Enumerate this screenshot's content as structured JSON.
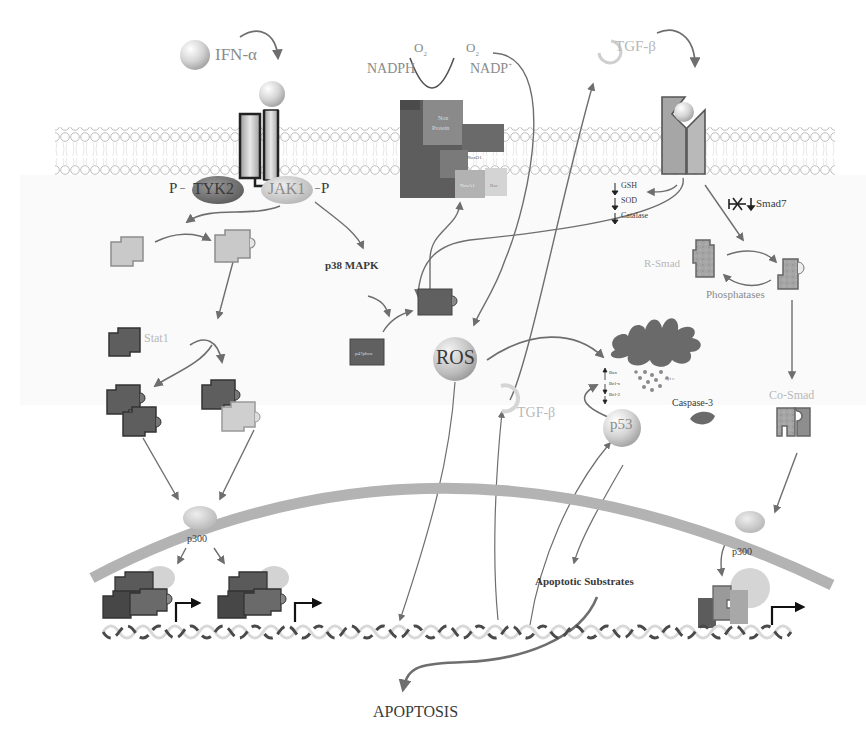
{
  "diagram": {
    "type": "signaling-pathway",
    "ligands": {
      "ifn": "IFN-α",
      "tgf_top": "TGF-β",
      "tgf_mid": "TGF-β"
    },
    "receptor_kinases": {
      "tyk2": "TYK2",
      "jak1": "JAK1",
      "phospho_left": "P",
      "phospho_right": "P"
    },
    "nadph_oxidase": {
      "o2_left": "O",
      "o2_left_sub": "2",
      "o2_right": "O",
      "o2_right_sub": "2",
      "nadph": "NADPH",
      "nadp": "NADP",
      "nadp_sup": "+",
      "subunits": [
        "Nox Protein",
        "p22phox",
        "p67phox",
        "NoxO1",
        "NoxA1",
        "Rac",
        "p47phox"
      ]
    },
    "cytoplasm": {
      "p38": "p38 MAPK",
      "p47_inactive": "p47phox",
      "p47_active": "p47phox",
      "ros": "ROS",
      "stat1": "Stat1",
      "antioxidants": [
        "GSH",
        "SOD",
        "Catalase"
      ],
      "smad7": "Smad7",
      "r_smad": "R-Smad",
      "phosphatases": "Phosphatases",
      "co_smad": "Co-Smad",
      "mito_factors": [
        "Bax",
        "Bcl-x",
        "Bcl-2"
      ],
      "cytc": "cyt c",
      "p53": "p53",
      "caspase3": "Caspase-3"
    },
    "nucleus": {
      "p300_left": "p300",
      "p300_right": "p300",
      "apoptotic_substrates": "Apoptotic Substrates"
    },
    "outcome": "APOPTOSIS",
    "colors": {
      "arrow": "#6e6e6e",
      "membrane": "#c8c8c8",
      "nuclear_envelope": "#9a9a9a",
      "dark_protein": "#5a5a5a",
      "light_protein": "#c9c9c9",
      "smad": "#8d8d8d"
    }
  }
}
